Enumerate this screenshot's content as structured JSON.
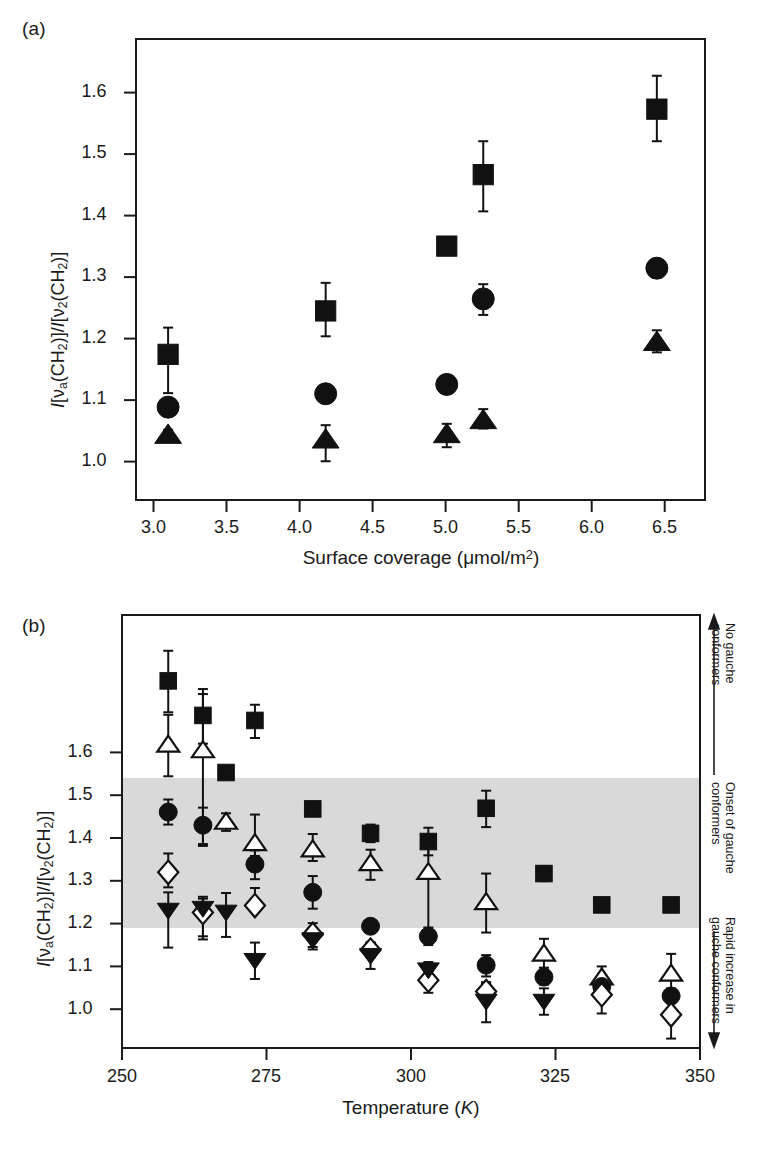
{
  "figure": {
    "panels": [
      {
        "id": "a",
        "label": "(a)",
        "xlabel_html": "Surface coverage (μmol/m<sup>2</sup>)",
        "ylabel_html": "<i>I</i>[ν<sub>a</sub>(CH<sub>2</sub>)]/<i>I</i>[ν<sub>2</sub>(CH<sub>2</sub>)]"
      },
      {
        "id": "b",
        "label": "(b)",
        "xlabel_html": "Temperature (<i>K</i>)",
        "ylabel_html": "<i>I</i>[ν<sub>a</sub>(CH<sub>2</sub>)]/<i>I</i>[ν<sub>2</sub>(CH<sub>2</sub>)]"
      }
    ],
    "annotations": [
      {
        "id": "no-gauche",
        "text": "No gauche\nconformers"
      },
      {
        "id": "onset-gauche",
        "text": "Onset of gauche\nconformers"
      },
      {
        "id": "rapid-increase",
        "text": "Rapid increase in\ngauche conformers"
      }
    ],
    "colors": {
      "axis": "#1a1a1a",
      "marker_fill": "#111111",
      "marker_open": "#ffffff",
      "band": "#d9d9d9"
    }
  },
  "chart_data": [
    {
      "type": "scatter",
      "panel": "a",
      "title": "(a)",
      "xlabel": "Surface coverage (μmol/m2)",
      "ylabel": "I[va(CH2)]/I[v2(CH2)]",
      "xlim": [
        2.88,
        6.78
      ],
      "ylim": [
        0.96,
        1.65
      ],
      "xticks": [
        3.0,
        3.5,
        4.0,
        4.5,
        5.0,
        5.5,
        6.0,
        6.5
      ],
      "xtick_labels": [
        "3.0",
        "3.5",
        "4.0",
        "4.5",
        "5.0",
        "5.5",
        "6.0",
        "6.5"
      ],
      "yticks": [
        1.0,
        1.1,
        1.2,
        1.3,
        1.4,
        1.5,
        1.6
      ],
      "ytick_labels": [
        "1.0",
        "1.1",
        "1.2",
        "1.3",
        "1.4",
        "1.5",
        "1.6"
      ],
      "grid": false,
      "legend": "none",
      "series": [
        {
          "name": "filled-square",
          "marker": "square",
          "fill": "solid",
          "points": [
            {
              "x": 3.1,
              "y": 1.178,
              "yerr_low": 0.058,
              "yerr_high": 0.04
            },
            {
              "x": 4.18,
              "y": 1.243,
              "yerr_low": 0.038,
              "yerr_high": 0.042
            },
            {
              "x": 5.01,
              "y": 1.34,
              "yerr_low": 0.012,
              "yerr_high": 0.012
            },
            {
              "x": 5.26,
              "y": 1.447,
              "yerr_low": 0.055,
              "yerr_high": 0.05
            },
            {
              "x": 6.45,
              "y": 1.545,
              "yerr_low": 0.048,
              "yerr_high": 0.05
            }
          ]
        },
        {
          "name": "filled-circle",
          "marker": "circle",
          "fill": "solid",
          "points": [
            {
              "x": 3.1,
              "y": 1.099,
              "yerr_low": 0.004,
              "yerr_high": 0.004
            },
            {
              "x": 4.18,
              "y": 1.119,
              "yerr_low": 0.004,
              "yerr_high": 0.004
            },
            {
              "x": 5.01,
              "y": 1.133,
              "yerr_low": 0.013,
              "yerr_high": 0.012
            },
            {
              "x": 5.26,
              "y": 1.261,
              "yerr_low": 0.024,
              "yerr_high": 0.022
            },
            {
              "x": 6.45,
              "y": 1.307,
              "yerr_low": 0.014,
              "yerr_high": 0.013
            }
          ]
        },
        {
          "name": "filled-triangle-up",
          "marker": "triangle-up",
          "fill": "solid",
          "points": [
            {
              "x": 3.1,
              "y": 1.057,
              "yerr_low": 0.006,
              "yerr_high": 0.008
            },
            {
              "x": 4.18,
              "y": 1.05,
              "yerr_low": 0.032,
              "yerr_high": 0.022
            },
            {
              "x": 5.01,
              "y": 1.058,
              "yerr_low": 0.019,
              "yerr_high": 0.016
            },
            {
              "x": 5.26,
              "y": 1.079,
              "yerr_low": 0.012,
              "yerr_high": 0.017
            },
            {
              "x": 6.45,
              "y": 1.196,
              "yerr_low": 0.015,
              "yerr_high": 0.018
            }
          ]
        }
      ]
    },
    {
      "type": "scatter",
      "panel": "b",
      "title": "(b)",
      "xlabel": "Temperature (K)",
      "ylabel": "I[va(CH2)]/I[v2(CH2)]",
      "xlim": [
        250,
        350
      ],
      "ylim": [
        0.96,
        1.65
      ],
      "xticks": [
        250,
        275,
        300,
        325,
        350
      ],
      "xtick_labels": [
        "250",
        "275",
        "300",
        "325",
        "350"
      ],
      "yticks": [
        1.0,
        1.1,
        1.2,
        1.3,
        1.4,
        1.5,
        1.6
      ],
      "ytick_labels": [
        "1.0",
        "1.1",
        "1.2",
        "1.3",
        "1.4",
        "1.5",
        "1.6"
      ],
      "grid": false,
      "legend": "none",
      "shaded_band": {
        "y_from": 1.2,
        "y_to": 1.4,
        "color": "#d9d9d9"
      },
      "series": [
        {
          "name": "filled-square",
          "marker": "square",
          "fill": "solid",
          "points": [
            {
              "x": 258,
              "y": 1.545,
              "yerr_low": 0.05,
              "yerr_high": 0.048
            },
            {
              "x": 264,
              "y": 1.49,
              "yerr_low": 0.045,
              "yerr_high": 0.042
            },
            {
              "x": 273,
              "y": 1.482,
              "yerr_low": 0.028,
              "yerr_high": 0.025
            },
            {
              "x": 268,
              "y": 1.399,
              "yerr_low": 0.006,
              "yerr_high": 0.006
            },
            {
              "x": 283,
              "y": 1.341,
              "yerr_low": 0.01,
              "yerr_high": 0.01
            },
            {
              "x": 293,
              "y": 1.302,
              "yerr_low": 0.014,
              "yerr_high": 0.014
            },
            {
              "x": 303,
              "y": 1.289,
              "yerr_low": 0.022,
              "yerr_high": 0.022
            },
            {
              "x": 313,
              "y": 1.342,
              "yerr_low": 0.03,
              "yerr_high": 0.028
            },
            {
              "x": 323,
              "y": 1.238,
              "yerr_low": 0.012,
              "yerr_high": 0.012
            },
            {
              "x": 333,
              "y": 1.188,
              "yerr_low": 0.004,
              "yerr_high": 0.004
            },
            {
              "x": 345,
              "y": 1.188,
              "yerr_low": 0.004,
              "yerr_high": 0.004
            }
          ]
        },
        {
          "name": "open-triangle-up",
          "marker": "triangle-up",
          "fill": "open",
          "points": [
            {
              "x": 258,
              "y": 1.443,
              "yerr_low": 0.05,
              "yerr_high": 0.048
            },
            {
              "x": 264,
              "y": 1.434,
              "yerr_low": 0.152,
              "yerr_high": 0.09
            },
            {
              "x": 268,
              "y": 1.32,
              "yerr_low": 0.014,
              "yerr_high": 0.014
            },
            {
              "x": 273,
              "y": 1.286,
              "yerr_low": 0.02,
              "yerr_high": 0.046
            },
            {
              "x": 283,
              "y": 1.276,
              "yerr_low": 0.018,
              "yerr_high": 0.025
            },
            {
              "x": 293,
              "y": 1.254,
              "yerr_low": 0.026,
              "yerr_high": 0.022
            },
            {
              "x": 303,
              "y": 1.24,
              "yerr_low": 0.102,
              "yerr_high": 0.05
            },
            {
              "x": 313,
              "y": 1.192,
              "yerr_low": 0.048,
              "yerr_high": 0.046
            },
            {
              "x": 323,
              "y": 1.11,
              "yerr_low": 0.022,
              "yerr_high": 0.024
            },
            {
              "x": 333,
              "y": 1.072,
              "yerr_low": 0.02,
              "yerr_high": 0.018
            },
            {
              "x": 345,
              "y": 1.078,
              "yerr_low": 0.024,
              "yerr_high": 0.032
            }
          ]
        },
        {
          "name": "filled-circle",
          "marker": "circle",
          "fill": "solid",
          "points": [
            {
              "x": 258,
              "y": 1.336,
              "yerr_low": 0.02,
              "yerr_high": 0.02
            },
            {
              "x": 264,
              "y": 1.315,
              "yerr_low": 0.03,
              "yerr_high": 0.028
            },
            {
              "x": 273,
              "y": 1.253,
              "yerr_low": 0.024,
              "yerr_high": 0.022
            },
            {
              "x": 283,
              "y": 1.208,
              "yerr_low": 0.026,
              "yerr_high": 0.026
            },
            {
              "x": 293,
              "y": 1.154,
              "yerr_low": 0.006,
              "yerr_high": 0.006
            },
            {
              "x": 303,
              "y": 1.138,
              "yerr_low": 0.014,
              "yerr_high": 0.014
            },
            {
              "x": 313,
              "y": 1.092,
              "yerr_low": 0.018,
              "yerr_high": 0.016
            },
            {
              "x": 323,
              "y": 1.073,
              "yerr_low": 0.012,
              "yerr_high": 0.012
            },
            {
              "x": 333,
              "y": 1.058,
              "yerr_low": 0.018,
              "yerr_high": 0.016
            },
            {
              "x": 345,
              "y": 1.043,
              "yerr_low": 0.012,
              "yerr_high": 0.012
            }
          ]
        },
        {
          "name": "open-diamond",
          "marker": "diamond",
          "fill": "open",
          "points": [
            {
              "x": 258,
              "y": 1.24,
              "yerr_low": 0.024,
              "yerr_high": 0.03
            },
            {
              "x": 264,
              "y": 1.176,
              "yerr_low": 0.038,
              "yerr_high": 0.022
            },
            {
              "x": 273,
              "y": 1.187,
              "yerr_low": 0.01,
              "yerr_high": 0.028
            },
            {
              "x": 283,
              "y": 1.141,
              "yerr_low": 0.02,
              "yerr_high": 0.018
            },
            {
              "x": 293,
              "y": 1.116,
              "yerr_low": 0.012,
              "yerr_high": 0.012
            },
            {
              "x": 303,
              "y": 1.068,
              "yerr_low": 0.02,
              "yerr_high": 0.018
            },
            {
              "x": 313,
              "y": 1.05,
              "yerr_low": 0.012,
              "yerr_high": 0.012
            },
            {
              "x": 333,
              "y": 1.045,
              "yerr_low": 0.03,
              "yerr_high": 0.028
            },
            {
              "x": 345,
              "y": 1.013,
              "yerr_low": 0.038,
              "yerr_high": 0.02
            }
          ]
        },
        {
          "name": "filled-triangle-down",
          "marker": "triangle-down",
          "fill": "solid",
          "points": [
            {
              "x": 258,
              "y": 1.18,
              "yerr_low": 0.06,
              "yerr_high": 0.028
            },
            {
              "x": 264,
              "y": 1.183,
              "yerr_low": 0.05,
              "yerr_high": 0.018
            },
            {
              "x": 268,
              "y": 1.177,
              "yerr_low": 0.04,
              "yerr_high": 0.03
            },
            {
              "x": 273,
              "y": 1.1,
              "yerr_low": 0.03,
              "yerr_high": 0.028
            },
            {
              "x": 283,
              "y": 1.133,
              "yerr_low": 0.016,
              "yerr_high": 0.016
            },
            {
              "x": 293,
              "y": 1.108,
              "yerr_low": 0.022,
              "yerr_high": 0.02
            },
            {
              "x": 303,
              "y": 1.085,
              "yerr_low": 0.012,
              "yerr_high": 0.012
            },
            {
              "x": 313,
              "y": 1.035,
              "yerr_low": 0.034,
              "yerr_high": 0.03
            },
            {
              "x": 323,
              "y": 1.035,
              "yerr_low": 0.022,
              "yerr_high": 0.02
            }
          ]
        }
      ]
    }
  ]
}
